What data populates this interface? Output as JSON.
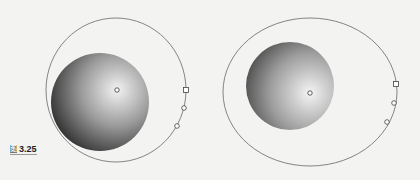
{
  "figure": {
    "caption_label": "图",
    "caption_number": "3.25"
  },
  "diagrams": [
    {
      "name": "left",
      "ellipse": {
        "cx": 116,
        "cy": 90,
        "rx": 70,
        "ry": 72
      },
      "sphere": {
        "cx": 100,
        "cy": 102,
        "r": 49
      },
      "center_point": {
        "x": 117,
        "y": 90
      },
      "handles": [
        {
          "type": "square",
          "x": 186,
          "y": 90
        },
        {
          "type": "circle",
          "x": 184,
          "y": 108
        },
        {
          "type": "circle",
          "x": 177,
          "y": 126
        }
      ]
    },
    {
      "name": "right",
      "ellipse": {
        "cx": 310,
        "cy": 92,
        "rx": 87,
        "ry": 74
      },
      "sphere": {
        "cx": 290,
        "cy": 86,
        "r": 44
      },
      "center_point": {
        "x": 310,
        "y": 93
      },
      "handles": [
        {
          "type": "square",
          "x": 396,
          "y": 84
        },
        {
          "type": "circle",
          "x": 394,
          "y": 103
        },
        {
          "type": "circle",
          "x": 387,
          "y": 122
        }
      ]
    }
  ],
  "colors": {
    "background": "#f3f3f1",
    "outline": "#777777",
    "sphere_dark": "#1a1a1a",
    "sphere_light": "#f0f0f0"
  }
}
